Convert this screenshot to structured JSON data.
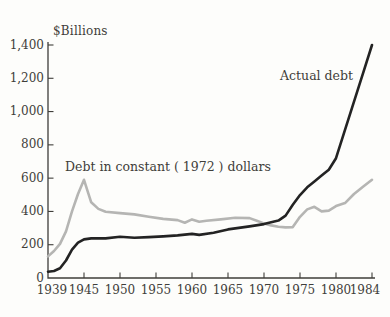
{
  "colors": {
    "background": "#fdfdfb",
    "axis": "#3f3e3a",
    "text": "#3f3e3a",
    "actual_debt_line": "#232323",
    "constant_dollar_line": "#b5b5b3"
  },
  "chart_data": {
    "type": "line",
    "title": "",
    "unit_label": "$Billions",
    "xlabel": "",
    "ylabel": "$Billions",
    "ylim": [
      0,
      1400
    ],
    "xlim_years": [
      1939,
      1984
    ],
    "grid": false,
    "legend_position": "inline-annotations",
    "y_ticks": [
      0,
      200,
      400,
      600,
      800,
      1000,
      1200,
      1400
    ],
    "y_tick_labels": [
      "0",
      "200",
      "400",
      "600",
      "800",
      "1,000",
      "1,200",
      "1,400"
    ],
    "x_tick_years": [
      1939,
      1945,
      1950,
      1955,
      1960,
      1965,
      1970,
      1975,
      1980,
      1984
    ],
    "x_tick_labels": [
      "1939",
      "1945",
      "1950",
      "1955",
      "1960",
      "1965",
      "1970",
      "1975",
      "1980",
      "1984"
    ],
    "series": [
      {
        "name": "Actual debt",
        "color": "#232323",
        "x": [
          1939,
          1940,
          1941,
          1942,
          1943,
          1944,
          1945,
          1946,
          1948,
          1950,
          1952,
          1954,
          1956,
          1958,
          1960,
          1961,
          1963,
          1965,
          1968,
          1970,
          1972,
          1973,
          1974,
          1975,
          1976,
          1977,
          1978,
          1979,
          1980,
          1981,
          1982,
          1983,
          1984
        ],
        "values": [
          38,
          42,
          58,
          105,
          170,
          212,
          232,
          238,
          238,
          248,
          242,
          246,
          250,
          256,
          265,
          259,
          272,
          292,
          310,
          324,
          345,
          375,
          440,
          498,
          545,
          580,
          615,
          650,
          720,
          890,
          1060,
          1230,
          1400
        ]
      },
      {
        "name": "Debt in constant ( 1972 ) dollars",
        "color": "#b5b5b3",
        "x": [
          1939,
          1940,
          1941,
          1942,
          1943,
          1944,
          1945,
          1946,
          1947,
          1948,
          1950,
          1952,
          1954,
          1956,
          1958,
          1959,
          1960,
          1961,
          1962,
          1964,
          1966,
          1968,
          1969,
          1970,
          1971,
          1972,
          1973,
          1974,
          1975,
          1976,
          1977,
          1978,
          1979,
          1980,
          1981,
          1982,
          1983,
          1984
        ],
        "values": [
          130,
          162,
          205,
          280,
          400,
          505,
          590,
          455,
          415,
          398,
          390,
          382,
          368,
          355,
          348,
          332,
          352,
          338,
          344,
          352,
          362,
          360,
          344,
          328,
          316,
          308,
          304,
          306,
          368,
          412,
          428,
          400,
          405,
          432,
          450,
          505,
          548,
          590
        ]
      }
    ]
  }
}
